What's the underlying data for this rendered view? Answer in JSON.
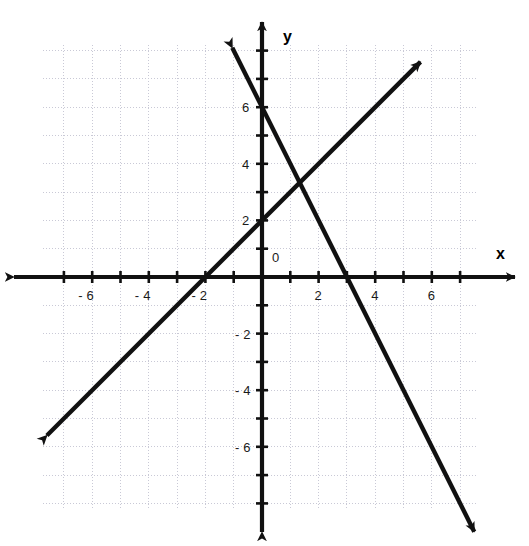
{
  "figure": {
    "kind": "cartesian-coordinate-plane",
    "background_color": "#ffffff",
    "ink_color": "#111111",
    "grid_color": "#c9c9d6",
    "axis_label_x": "x",
    "axis_label_y": "y",
    "origin_label": "0"
  },
  "chart_data": {
    "type": "line",
    "title": "",
    "subtitle": "",
    "xlabel": "x",
    "ylabel": "y",
    "xlim": [
      -7.75,
      9.5
    ],
    "ylim": [
      -9.6,
      8.2
    ],
    "grid": true,
    "grid_step": 1,
    "grid_extent": {
      "x": [
        -7.75,
        7.6
      ],
      "y": [
        -8.2,
        8.2
      ]
    },
    "legend_position": "none",
    "axis_arrows": "both-ends",
    "xticks": [
      -6,
      -4,
      -2,
      2,
      4,
      6
    ],
    "xtick_labels": [
      "- 6",
      "- 4",
      "- 2",
      "2",
      "4",
      "6"
    ],
    "yticks": [
      6,
      4,
      2,
      -2,
      -4,
      -6
    ],
    "ytick_labels": [
      "6",
      "4",
      "2",
      "- 2",
      "- 4",
      "- 6"
    ],
    "minor_tick_step": 1,
    "series": [
      {
        "name": "line-1",
        "equation": "y = x + 2",
        "slope": 1,
        "y_intercept": 2,
        "x_intercept": -2,
        "color": "#111111",
        "endpoints": [
          [
            -7.6,
            -5.6
          ],
          [
            5.6,
            7.6
          ]
        ],
        "arrowheads": "both",
        "points": [
          [
            -2,
            0
          ],
          [
            0,
            2
          ],
          [
            3,
            5
          ]
        ]
      },
      {
        "name": "line-2",
        "equation": "y = -2x + 6",
        "slope": -2,
        "y_intercept": 6,
        "x_intercept": 3,
        "color": "#111111",
        "endpoints": [
          [
            -1.05,
            8.1
          ],
          [
            7.5,
            -9.0
          ]
        ],
        "arrowheads": "both",
        "points": [
          [
            0,
            6
          ],
          [
            3,
            0
          ],
          [
            5,
            -4
          ]
        ]
      }
    ],
    "intersection": [
      1.33,
      3.33
    ],
    "annotations": []
  },
  "tick_labels": {
    "x": [
      {
        "text": "- 6",
        "value": -6
      },
      {
        "text": "- 4",
        "value": -4
      },
      {
        "text": "- 2",
        "value": -2
      },
      {
        "text": "2",
        "value": 2
      },
      {
        "text": "4",
        "value": 4
      },
      {
        "text": "6",
        "value": 6
      }
    ],
    "y": [
      {
        "text": "6",
        "value": 6
      },
      {
        "text": "4",
        "value": 4
      },
      {
        "text": "2",
        "value": 2
      },
      {
        "text": "- 2",
        "value": -2
      },
      {
        "text": "- 4",
        "value": -4
      },
      {
        "text": "- 6",
        "value": -6
      }
    ]
  }
}
